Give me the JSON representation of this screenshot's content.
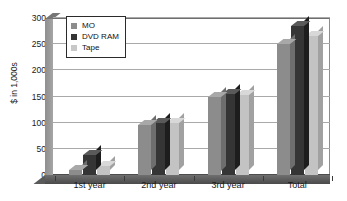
{
  "chart_data": {
    "type": "bar",
    "title": "",
    "subtitle": "",
    "xlabel": "",
    "ylabel": "$ in 1,000s",
    "categories": [
      "1st year",
      "2nd year",
      "3rd year",
      "Total"
    ],
    "series": [
      {
        "name": "MO",
        "color": "#8c8c8c",
        "values": [
          10,
          95,
          150,
          250
        ]
      },
      {
        "name": "DVD RAM",
        "color": "#353535",
        "values": [
          38,
          100,
          155,
          285
        ]
      },
      {
        "name": "Tape",
        "color": "#c3c3c3",
        "values": [
          18,
          100,
          152,
          265
        ]
      }
    ],
    "ylim": [
      0,
      300
    ],
    "yticks": [
      0,
      50,
      100,
      150,
      200,
      250,
      300
    ],
    "ytick_labels": [
      "0",
      "50",
      "100",
      "150",
      "200",
      "250",
      "300"
    ],
    "grid": true,
    "grid_axis": "y",
    "legend": {
      "position": "upper-left-inside",
      "border": true,
      "entries": [
        "MO",
        "DVD RAM",
        "Tape"
      ]
    },
    "style": "3d-clustered-column",
    "background": "#ffffff"
  }
}
